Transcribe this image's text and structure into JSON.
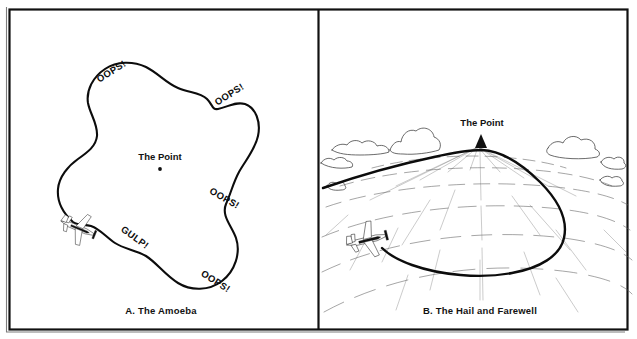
{
  "figure": {
    "background_color": "#ffffff",
    "ink_color": "#101010",
    "panels": [
      {
        "id": "panel-a",
        "caption": "A.  The Amoeba",
        "center_label": "The Point",
        "annotations": [
          {
            "text": "OOPS!",
            "position": "upper-left",
            "x": 113,
            "y": 74,
            "rotation": -32
          },
          {
            "text": "OOPS!",
            "position": "upper-right",
            "x": 213,
            "y": 99,
            "rotation": -32
          },
          {
            "text": "OOPS!",
            "position": "right",
            "x": 208,
            "y": 193,
            "rotation": 30
          },
          {
            "text": "GULP!",
            "position": "lower-left",
            "x": 118,
            "y": 237,
            "rotation": 34
          },
          {
            "text": "OOPS!",
            "position": "lower-right",
            "x": 196,
            "y": 276,
            "rotation": 32
          }
        ],
        "aircraft_count": 1
      },
      {
        "id": "panel-b",
        "caption": "B.  The Hail and Farewell",
        "center_label": "The Point",
        "annotations": [],
        "aircraft_count": 1
      }
    ]
  }
}
